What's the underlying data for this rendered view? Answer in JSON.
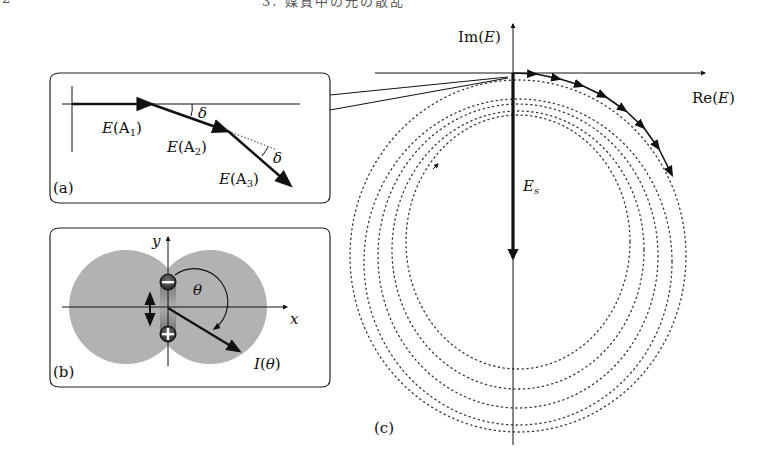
{
  "header": {
    "page_number": "2",
    "running_title": "3. 媒質中の光の散乱"
  },
  "figure": {
    "panel_a": {
      "label": "(a)",
      "vectors": [
        "E(A",
        "E(A",
        "E(A"
      ],
      "subscripts": [
        "1",
        "2",
        "3"
      ],
      "close_paren": ")",
      "angle_symbol": "δ"
    },
    "panel_b": {
      "label": "(b)",
      "x_axis": "x",
      "y_axis": "y",
      "angle_symbol": "θ",
      "intensity_label_prefix": "I(",
      "intensity_label_var": "θ",
      "intensity_label_suffix": ")",
      "charge_top": "−",
      "charge_bottom": "+",
      "lobe_color": "#b0b0b0"
    },
    "panel_c": {
      "label": "(c)",
      "real_axis_prefix": "Re(",
      "real_axis_var": "E",
      "imag_axis_prefix": "Im(",
      "imag_axis_var": "E",
      "axis_suffix": ")",
      "scattered_field_var": "E",
      "scattered_field_sub": "s",
      "dotted_circle_count": 5
    }
  }
}
